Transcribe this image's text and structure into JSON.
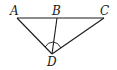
{
  "diagram": {
    "type": "geometry",
    "points": {
      "A": {
        "label": "A",
        "x": 17,
        "y": 18
      },
      "B": {
        "label": "B",
        "x": 57,
        "y": 18
      },
      "C": {
        "label": "C",
        "x": 104,
        "y": 18
      },
      "D": {
        "label": "D",
        "x": 52,
        "y": 54
      }
    },
    "segments": [
      "AC",
      "AD",
      "CD",
      "BD"
    ],
    "angle_marks": [
      "ADB",
      "BDC"
    ]
  }
}
